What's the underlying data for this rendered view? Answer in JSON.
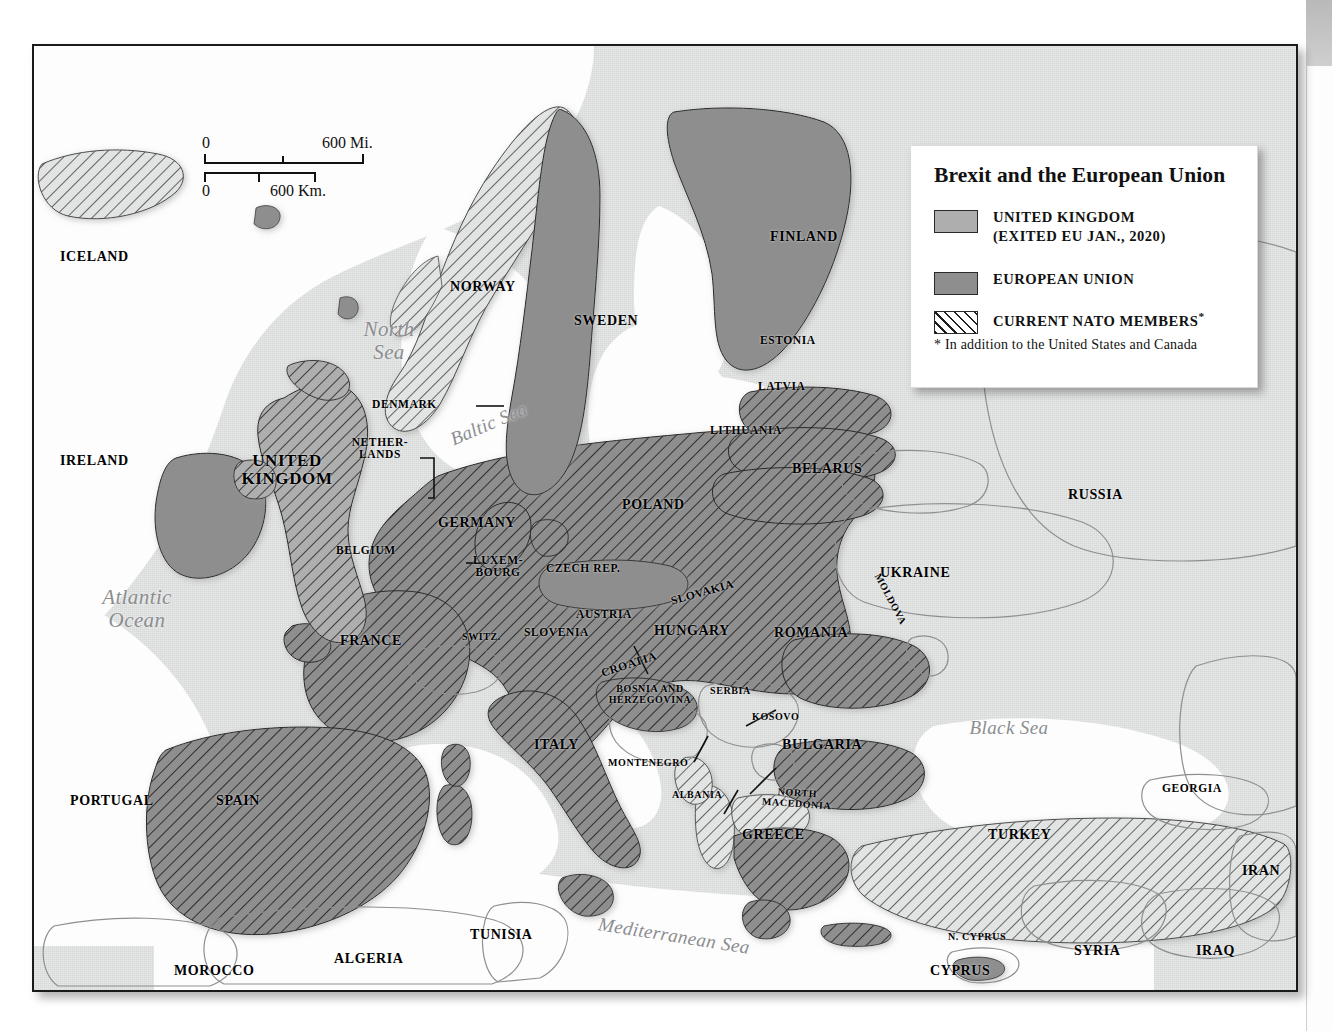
{
  "legend": {
    "title": "Brexit and the European Union",
    "rows": [
      {
        "swatch": "uk-swatch",
        "line1": "UNITED KINGDOM",
        "line2": "(EXITED EU JAN., 2020)"
      },
      {
        "swatch": "eu-swatch",
        "line1": "EUROPEAN UNION",
        "line2": ""
      },
      {
        "swatch": "nato-swatch",
        "line1": "CURRENT NATO MEMBERS",
        "line2": ""
      }
    ],
    "footnote": "In addition to the United States and Canada",
    "star": "*",
    "colors": {
      "uk": "#aeaeae",
      "eu": "#8e8e8e",
      "nato_hatch": "#1d1d1d"
    }
  },
  "scale": {
    "miles_zero": "0",
    "miles_max": "600 Mi.",
    "km_zero": "0",
    "km_max": "600 Km."
  },
  "credit": "LUCIDITY INFORMATION DESIGN, L.L.C.",
  "seas": [
    {
      "name": "north-sea",
      "text": "North\nSea"
    },
    {
      "name": "baltic-sea",
      "text": "Baltic Sea"
    },
    {
      "name": "atlantic-ocean",
      "text": "Atlantic\nOcean"
    },
    {
      "name": "mediterranean-sea",
      "text": "Mediterranean Sea"
    },
    {
      "name": "black-sea",
      "text": "Black Sea"
    }
  ],
  "labels": {
    "iceland": "ICELAND",
    "norway": "NORWAY",
    "sweden": "SWEDEN",
    "finland": "FINLAND",
    "estonia": "ESTONIA",
    "latvia": "LATVIA",
    "lithuania": "LITHUANIA",
    "denmark": "DENMARK",
    "netherlands": "NETHER-\nLANDS",
    "ireland": "IRELAND",
    "united_kingdom": "UNITED\nKINGDOM",
    "belgium": "BELGIUM",
    "luxembourg": "LUXEM-\nBOURG",
    "germany": "GERMANY",
    "poland": "POLAND",
    "belarus": "BELARUS",
    "russia": "RUSSIA",
    "ukraine": "UKRAINE",
    "moldova": "MOLDOVA",
    "czech_rep": "CZECH REP.",
    "slovakia": "SLOVAKIA",
    "austria": "AUSTRIA",
    "hungary": "HUNGARY",
    "romania": "ROMANIA",
    "switzerland": "SWITZ.",
    "slovenia": "SLOVENIA",
    "croatia": "CROATIA",
    "bosnia": "BOSNIA AND\nHERZEGOVINA",
    "serbia": "SERBIA",
    "kosovo": "KOSOVO",
    "montenegro": "MONTENEGRO",
    "albania": "ALBANIA",
    "north_macedonia": "NORTH\nMACEDONIA",
    "bulgaria": "BULGARIA",
    "greece": "GREECE",
    "italy": "ITALY",
    "france": "FRANCE",
    "spain": "SPAIN",
    "portugal": "PORTUGAL",
    "morocco": "MOROCCO",
    "algeria": "ALGERIA",
    "tunisia": "TUNISIA",
    "turkey": "TURKEY",
    "georgia": "GEORGIA",
    "iran": "IRAN",
    "iraq": "IRAQ",
    "syria": "SYRIA",
    "cyprus": "CYPRUS",
    "n_cyprus": "N. CYPRUS"
  }
}
